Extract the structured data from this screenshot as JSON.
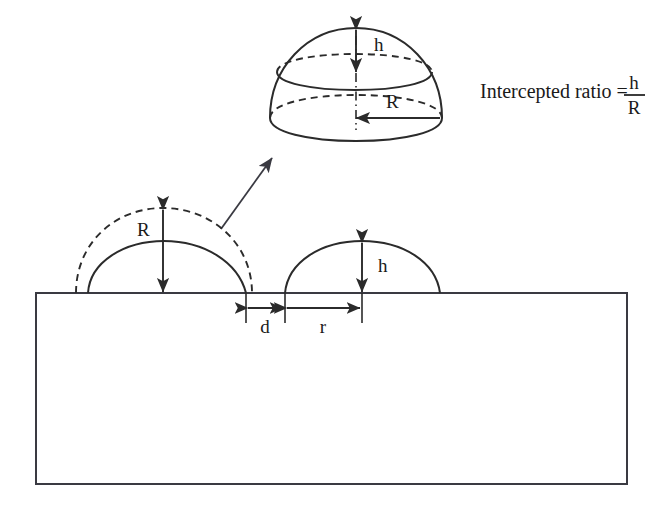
{
  "figure": {
    "background_color": "#ffffff",
    "stroke_color": "#2b2b2b"
  },
  "callout": {
    "name": "hemisphere-detail",
    "labels": {
      "height_label": "h",
      "radius_label": "R"
    },
    "equation": {
      "lead_text": "Intercepted ratio =",
      "numerator": "h",
      "denominator": "R"
    }
  },
  "profile": {
    "name": "cross-section-profile",
    "labels": {
      "full_radius_label": "R",
      "cap_height_label": "h",
      "gap_label": "d",
      "cap_radius_label": "r"
    }
  },
  "substrate": {
    "name": "substrate-block",
    "fill": "#ffffff"
  }
}
